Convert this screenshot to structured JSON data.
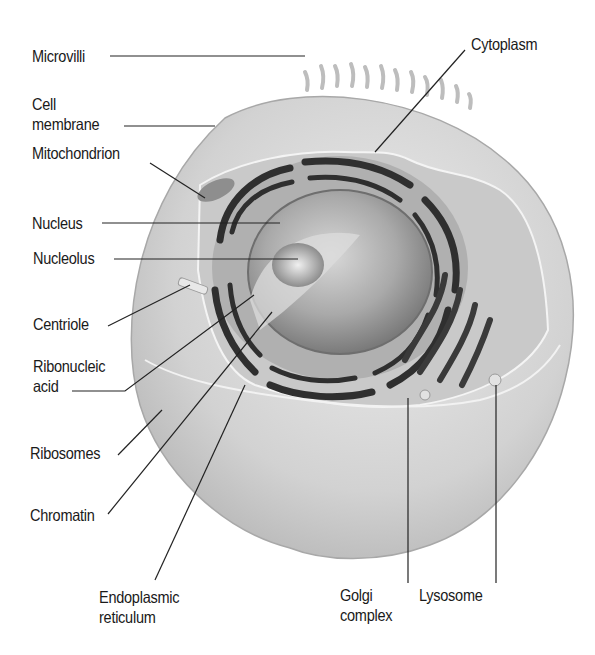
{
  "diagram": {
    "style": "grayscale",
    "colors": {
      "background": "#ffffff",
      "text": "#1a1a1a",
      "leader_lines": "#222222",
      "cell_light": "#e4e4e4",
      "cell_mid": "#bdbdbd",
      "organelle_dark": "#3a3a3a"
    },
    "labels": [
      {
        "id": "microvilli",
        "line1": "Microvilli",
        "line2": ""
      },
      {
        "id": "cell-membrane",
        "line1": "Cell",
        "line2": "membrane"
      },
      {
        "id": "mitochondrion",
        "line1": "Mitochondrion",
        "line2": ""
      },
      {
        "id": "nucleus",
        "line1": "Nucleus",
        "line2": ""
      },
      {
        "id": "nucleolus",
        "line1": "Nucleolus",
        "line2": ""
      },
      {
        "id": "centriole",
        "line1": "Centriole",
        "line2": ""
      },
      {
        "id": "ribonucleic-acid",
        "line1": "Ribonucleic",
        "line2": "acid"
      },
      {
        "id": "ribosomes",
        "line1": "Ribosomes",
        "line2": ""
      },
      {
        "id": "chromatin",
        "line1": "Chromatin",
        "line2": ""
      },
      {
        "id": "endoplasmic-reticulum",
        "line1": "Endoplasmic",
        "line2": "reticulum"
      },
      {
        "id": "golgi-complex",
        "line1": "Golgi",
        "line2": "complex"
      },
      {
        "id": "lysosome",
        "line1": "Lysosome",
        "line2": ""
      },
      {
        "id": "cytoplasm",
        "line1": "Cytoplasm",
        "line2": ""
      }
    ]
  }
}
